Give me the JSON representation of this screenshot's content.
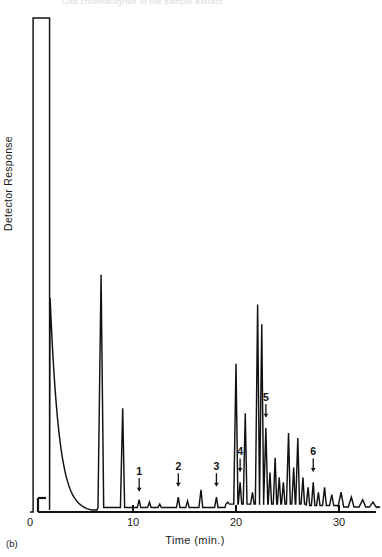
{
  "figure": {
    "panel_label": "(b)",
    "top_caption": "Gas chromatogram of the sample extract",
    "axis_color": "#111111",
    "trace_color": "#111111"
  },
  "chart_data": {
    "type": "line",
    "title": "",
    "subtitle": "",
    "xlabel": "Time (min.)",
    "ylabel": "Detector Response",
    "xlim": [
      0,
      34
    ],
    "ylim": [
      0,
      100
    ],
    "grid": false,
    "legend_position": "none",
    "xticks": [
      0,
      10,
      20,
      30
    ],
    "xticklabels": [
      "0",
      "10",
      "20",
      "30"
    ],
    "yticks": [],
    "yticklabels": [],
    "annotations": [
      {
        "label": "1",
        "x": 10.6,
        "arrow": "down",
        "peak_height": 3
      },
      {
        "label": "2",
        "x": 14.4,
        "arrow": "down",
        "peak_height": 4
      },
      {
        "label": "3",
        "x": 18.1,
        "arrow": "down",
        "peak_height": 4
      },
      {
        "label": "4",
        "x": 20.4,
        "arrow": "down",
        "peak_height": 7
      },
      {
        "label": "5",
        "x": 22.9,
        "arrow": "down",
        "peak_height": 18
      },
      {
        "label": "6",
        "x": 27.5,
        "arrow": "down",
        "peak_height": 7
      }
    ],
    "series": [
      {
        "name": "Detector signal",
        "baseline": 0,
        "solvent_peak": {
          "x_start": 0.3,
          "x_end": 1.9,
          "height": 100,
          "shape": "flat-topped off-scale"
        },
        "peaks": [
          {
            "x": 6.9,
            "height": 48,
            "width": 0.3
          },
          {
            "x": 9.0,
            "height": 21,
            "width": 0.22
          },
          {
            "x": 10.6,
            "height": 2.5,
            "width": 0.18
          },
          {
            "x": 11.6,
            "height": 2.0,
            "width": 0.18
          },
          {
            "x": 12.6,
            "height": 1.6,
            "width": 0.18
          },
          {
            "x": 14.4,
            "height": 3.0,
            "width": 0.18
          },
          {
            "x": 15.3,
            "height": 2.2,
            "width": 0.18
          },
          {
            "x": 16.6,
            "height": 4.5,
            "width": 0.2
          },
          {
            "x": 18.1,
            "height": 3.0,
            "width": 0.18
          },
          {
            "x": 19.2,
            "height": 2.0,
            "width": 0.18
          },
          {
            "x": 20.0,
            "height": 30,
            "width": 0.22
          },
          {
            "x": 20.4,
            "height": 6.0,
            "width": 0.18
          },
          {
            "x": 20.9,
            "height": 20,
            "width": 0.2
          },
          {
            "x": 21.6,
            "height": 4.0,
            "width": 0.18
          },
          {
            "x": 22.1,
            "height": 42,
            "width": 0.22
          },
          {
            "x": 22.5,
            "height": 38,
            "width": 0.22
          },
          {
            "x": 22.9,
            "height": 17,
            "width": 0.22
          },
          {
            "x": 23.3,
            "height": 8.0,
            "width": 0.18
          },
          {
            "x": 23.8,
            "height": 11,
            "width": 0.18
          },
          {
            "x": 24.2,
            "height": 7.0,
            "width": 0.18
          },
          {
            "x": 24.6,
            "height": 6.0,
            "width": 0.18
          },
          {
            "x": 25.1,
            "height": 16,
            "width": 0.2
          },
          {
            "x": 25.6,
            "height": 9.0,
            "width": 0.18
          },
          {
            "x": 26.0,
            "height": 15,
            "width": 0.2
          },
          {
            "x": 26.5,
            "height": 7.0,
            "width": 0.18
          },
          {
            "x": 27.0,
            "height": 5.0,
            "width": 0.18
          },
          {
            "x": 27.5,
            "height": 6.0,
            "width": 0.18
          },
          {
            "x": 28.0,
            "height": 4.0,
            "width": 0.18
          },
          {
            "x": 28.6,
            "height": 5.0,
            "width": 0.2
          },
          {
            "x": 29.3,
            "height": 3.5,
            "width": 0.22
          },
          {
            "x": 30.2,
            "height": 4.0,
            "width": 0.3
          },
          {
            "x": 31.2,
            "height": 3.0,
            "width": 0.3
          },
          {
            "x": 32.3,
            "height": 2.5,
            "width": 0.35
          },
          {
            "x": 33.3,
            "height": 2.0,
            "width": 0.35
          }
        ]
      }
    ]
  }
}
